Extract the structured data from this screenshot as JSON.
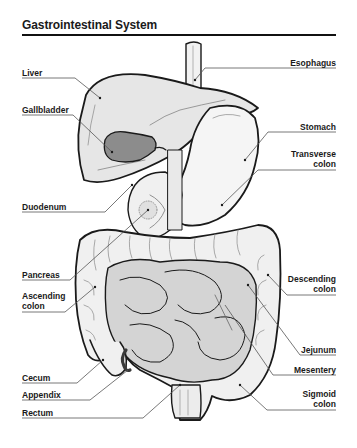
{
  "title": "Gastrointestinal System",
  "labels_left": {
    "liver": "Liver",
    "gallbladder": "Gallbladder",
    "duodenum": "Duodenum",
    "pancreas": "Pancreas",
    "ascending_colon_1": "Ascending",
    "ascending_colon_2": "colon",
    "cecum": "Cecum",
    "appendix": "Appendix",
    "rectum": "Rectum"
  },
  "labels_right": {
    "esophagus": "Esophagus",
    "stomach": "Stomach",
    "transverse_colon_1": "Transverse",
    "transverse_colon_2": "colon",
    "descending_colon_1": "Descending",
    "descending_colon_2": "colon",
    "jejunum": "Jejunum",
    "mesentery": "Mesentery",
    "sigmoid_colon_1": "Sigmoid",
    "sigmoid_colon_2": "colon"
  },
  "colors": {
    "outline": "#1a1a1a",
    "organ_fill": "#e6e6e6",
    "organ_light": "#f2f2f2",
    "gallbladder_fill": "#8c8c8c",
    "intestine_fill": "#d4d4d4",
    "leader_line": "#555555"
  }
}
